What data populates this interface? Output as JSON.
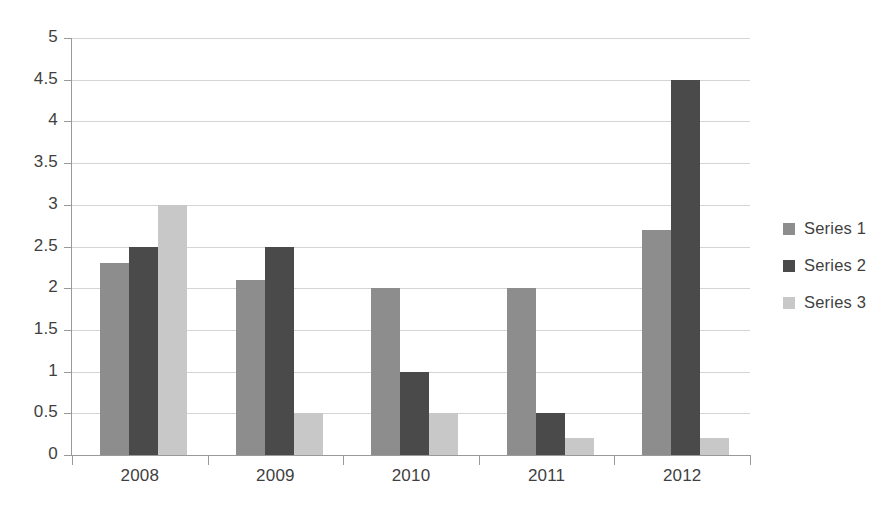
{
  "chart_data": {
    "type": "bar",
    "title": "",
    "xlabel": "",
    "ylabel": "",
    "categories": [
      "2008",
      "2009",
      "2010",
      "2011",
      "2012"
    ],
    "series": [
      {
        "name": "Series 1",
        "color": "#8d8d8d",
        "values": [
          2.3,
          2.1,
          2.0,
          2.0,
          2.7
        ]
      },
      {
        "name": "Series 2",
        "color": "#4a4a4a",
        "values": [
          2.5,
          2.5,
          1.0,
          0.5,
          4.5
        ]
      },
      {
        "name": "Series 3",
        "color": "#c8c8c8",
        "values": [
          3.0,
          0.5,
          0.5,
          0.2,
          0.2
        ]
      }
    ],
    "ylim": [
      0,
      5
    ],
    "ytick_values": [
      0,
      0.5,
      1,
      1.5,
      2,
      2.5,
      3,
      3.5,
      4,
      4.5,
      5
    ],
    "ytick_labels": [
      "0",
      "0.5",
      "1",
      "1.5",
      "2",
      "2.5",
      "3",
      "3.5",
      "4",
      "4.5",
      "5"
    ],
    "grid": true,
    "grid_axis": "y",
    "legend_position": "right",
    "background_color": "#ffffff",
    "axis_color": "#9a9a9a",
    "gridline_color": "#d4d4d4"
  }
}
